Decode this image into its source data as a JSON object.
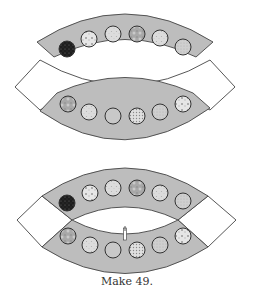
{
  "caption": "Make 49.",
  "colors": {
    "arc_fill": "#bdbdbd",
    "band_fill": "#ffffff",
    "stroke": "#444444",
    "background": "#ffffff"
  },
  "figures": [
    {
      "id": "exploded",
      "description": "Arc units shown separated",
      "top_arc": {
        "path": "M37,42 Q125,-14 213,42 L196,57 Q125,22 54,57 Z",
        "circles": [
          {
            "cx": 67,
            "cy": 49,
            "fill": "#1e1e1e",
            "pattern": "dark-speckle"
          },
          {
            "cx": 89,
            "cy": 39,
            "fill": "#e6e6e6",
            "pattern": "floral"
          },
          {
            "cx": 113,
            "cy": 34,
            "fill": "#d9d9d9",
            "pattern": "light-print"
          },
          {
            "cx": 137,
            "cy": 34,
            "fill": "#a8a8a8",
            "pattern": "mottled"
          },
          {
            "cx": 160,
            "cy": 38,
            "fill": "#e3e3e3",
            "pattern": "light-print"
          },
          {
            "cx": 183,
            "cy": 47,
            "fill": "#c4c4c4",
            "pattern": "speckle"
          }
        ]
      },
      "band": {
        "path": "M15,87 L40,60 Q125,110 210,60 L235,87 L210,110 Q125,60 40,110 Z"
      },
      "bottom_arc": {
        "path": "M40,111 L57,93 Q125,62 193,93 L210,108 Q125,170 40,111 Z",
        "circles": [
          {
            "cx": 68,
            "cy": 104,
            "fill": "#a6a6a6",
            "pattern": "mottled"
          },
          {
            "cx": 89,
            "cy": 112,
            "fill": "#e3e3e3",
            "pattern": "light-print"
          },
          {
            "cx": 113,
            "cy": 116,
            "fill": "#c8c8c8",
            "pattern": "plain"
          },
          {
            "cx": 137,
            "cy": 116,
            "fill": "#dcdcdc",
            "pattern": "dots"
          },
          {
            "cx": 160,
            "cy": 112,
            "fill": "#e6e6e6",
            "pattern": "speckle"
          },
          {
            "cx": 183,
            "cy": 104,
            "fill": "#bdbdbd",
            "pattern": "floral"
          }
        ]
      }
    },
    {
      "id": "assembled",
      "description": "Arc units sewn together",
      "top_arc": {
        "path": "M42,196 Q125,140 208,196 L178,220 Q125,194 72,220 Z",
        "circles": [
          {
            "cx": 67,
            "cy": 203,
            "fill": "#1e1e1e",
            "pattern": "dark-speckle"
          },
          {
            "cx": 90,
            "cy": 193,
            "fill": "#e6e6e6",
            "pattern": "floral"
          },
          {
            "cx": 113,
            "cy": 188,
            "fill": "#d9d9d9",
            "pattern": "light-print"
          },
          {
            "cx": 137,
            "cy": 188,
            "fill": "#a8a8a8",
            "pattern": "mottled"
          },
          {
            "cx": 160,
            "cy": 193,
            "fill": "#e3e3e3",
            "pattern": "light-print"
          },
          {
            "cx": 183,
            "cy": 201,
            "fill": "#c4c4c4",
            "pattern": "speckle"
          }
        ]
      },
      "left_piece": {
        "path": "M17,220 L42,196 L72,220 L42,247 Z"
      },
      "right_piece": {
        "path": "M178,220 L208,196 L236,220 L208,247 Z"
      },
      "bottom_arc": {
        "path": "M72,220 Q125,248 178,220 L208,247 Q125,300 42,247 Z",
        "circles": [
          {
            "cx": 68,
            "cy": 236,
            "fill": "#a6a6a6",
            "pattern": "mottled"
          },
          {
            "cx": 90,
            "cy": 245,
            "fill": "#e3e3e3",
            "pattern": "light-print"
          },
          {
            "cx": 113,
            "cy": 250,
            "fill": "#c8c8c8",
            "pattern": "plain"
          },
          {
            "cx": 137,
            "cy": 250,
            "fill": "#dcdcdc",
            "pattern": "dots"
          },
          {
            "cx": 160,
            "cy": 245,
            "fill": "#e6e6e6",
            "pattern": "speckle"
          },
          {
            "cx": 183,
            "cy": 236,
            "fill": "#bdbdbd",
            "pattern": "floral"
          }
        ]
      },
      "clip_marker": {
        "x": 125,
        "y1": 228,
        "y2": 240
      }
    }
  ],
  "circle_radius": 8
}
